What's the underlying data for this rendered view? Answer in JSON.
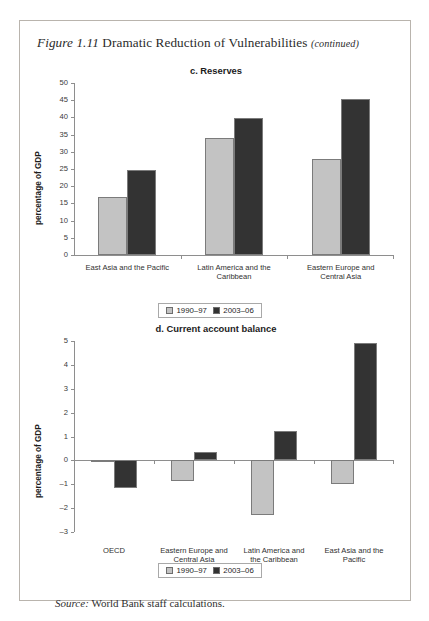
{
  "figure": {
    "label": "Figure 1.11",
    "title": "Dramatic Reduction of Vulnerabilities",
    "continued": "(continued)"
  },
  "source": {
    "label": "Source:",
    "text": "World Bank staff calculations."
  },
  "legend": {
    "series1_label": "1990–97",
    "series2_label": "2003–06",
    "series1_color": "#c3c3c3",
    "series2_color": "#333333"
  },
  "chart_data": [
    {
      "type": "bar",
      "id": "c",
      "title": "c. Reserves",
      "xlabel": "",
      "ylabel": "percentage of GDP",
      "ylim": [
        0,
        50
      ],
      "yticks": [
        0,
        5,
        10,
        15,
        20,
        25,
        30,
        35,
        40,
        45,
        50
      ],
      "ytick_labels": [
        "0",
        "5",
        "10",
        "15",
        "20",
        "25",
        "30",
        "35",
        "40",
        "45",
        "50"
      ],
      "grid": false,
      "legend_position": "bottom",
      "categories": [
        "East Asia and the Pacific",
        "Latin America and the\nCaribbean",
        "Eastern Europe and\nCentral Asia"
      ],
      "series": [
        {
          "name": "1990–97",
          "color": "#c3c3c3",
          "values": [
            17.0,
            34.0,
            28.0
          ]
        },
        {
          "name": "2003–06",
          "color": "#333333",
          "values": [
            24.7,
            39.8,
            45.3
          ]
        }
      ]
    },
    {
      "type": "bar",
      "id": "d",
      "title": "d. Current account balance",
      "xlabel": "",
      "ylabel": "percentage of GDP",
      "ylim": [
        -3,
        5
      ],
      "yticks": [
        -3,
        -2,
        -1,
        0,
        1,
        2,
        3,
        4,
        5
      ],
      "ytick_labels": [
        "–3",
        "–2",
        "–1",
        "0",
        "1",
        "2",
        "3",
        "4",
        "5"
      ],
      "grid": false,
      "legend_position": "bottom",
      "categories": [
        "OECD",
        "Eastern Europe and\nCentral Asia",
        "Latin America and\nthe Caribbean",
        "East Asia and the\nPacific"
      ],
      "series": [
        {
          "name": "1990–97",
          "color": "#c3c3c3",
          "values": [
            -0.07,
            -0.85,
            -2.3,
            -1.0
          ]
        },
        {
          "name": "2003–06",
          "color": "#333333",
          "values": [
            -1.15,
            0.35,
            1.25,
            4.9
          ]
        }
      ]
    }
  ]
}
